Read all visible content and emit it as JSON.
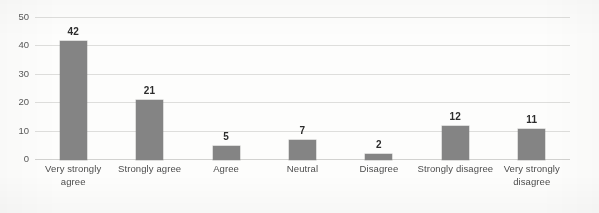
{
  "chart_data": {
    "type": "bar",
    "title": "",
    "subtitle": "",
    "xlabel": "",
    "ylabel": "",
    "categories": [
      "Very strongly agree",
      "Strongly agree",
      "Agree",
      "Neutral",
      "Disagree",
      "Strongly disagree",
      "Very strongly disagree"
    ],
    "values": [
      42,
      21,
      5,
      7,
      2,
      12,
      11
    ],
    "data_labels": [
      "42",
      "21",
      "5",
      "7",
      "2",
      "12",
      "11"
    ],
    "ylim": [
      0,
      50
    ],
    "yticks": [
      0,
      10,
      20,
      30,
      40,
      50
    ],
    "ytick_labels": [
      "0",
      "10",
      "20",
      "30",
      "40",
      "50"
    ],
    "grid": true,
    "grid_axis": "y",
    "legend": false,
    "legend_position": "none",
    "series": [
      {
        "name": "",
        "values": [
          42,
          21,
          5,
          7,
          2,
          12,
          11
        ],
        "color": "#848484"
      }
    ],
    "colors": {
      "bar": "#848484",
      "gridline": "#dededc",
      "axis_text": "#4d4d4d",
      "data_label": "#2c2c2c",
      "background": "#fdfdfc"
    }
  }
}
